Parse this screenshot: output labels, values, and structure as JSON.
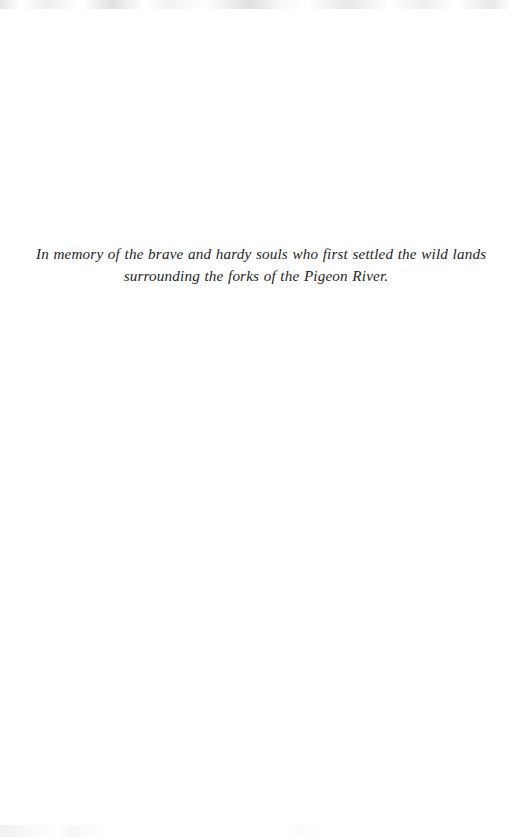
{
  "page": {
    "kind": "book-dedication-page",
    "background_color": "#ffffff",
    "width": 512,
    "height": 837
  },
  "dedication": {
    "lines": [
      "In memory of the brave and hardy souls who first settled the wild lands",
      "surrounding the forks of the Pigeon River."
    ],
    "full_text": "In memory of the brave and hardy souls who first settled the wild lands surrounding the forks of the Pigeon River.",
    "text_color": "#262428",
    "alignment": "center",
    "style": "italic serif"
  },
  "artifacts": {
    "top_smudge": "scan-smudge-top-edge",
    "bottom_smudge": "scan-smudge-bottom-left"
  }
}
